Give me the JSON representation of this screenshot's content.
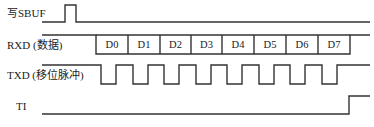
{
  "signals": [
    {
      "name": "sbuf",
      "label": "写SBUF",
      "label_x": 7,
      "label_y": 8
    },
    {
      "name": "rxd",
      "label": "RXD (数据)",
      "label_x": 7,
      "label_y": 40
    },
    {
      "name": "txd",
      "label": "TXD (移位脉冲)",
      "label_x": 7,
      "label_y": 70
    },
    {
      "name": "ti",
      "label": "TI",
      "label_x": 16,
      "label_y": 101
    }
  ],
  "rxd_bits": [
    "D0",
    "D1",
    "D2",
    "D3",
    "D4",
    "D5",
    "D6",
    "D7"
  ],
  "colors": {
    "line": "#333333",
    "text": "#222222",
    "background": "#ffffff"
  }
}
